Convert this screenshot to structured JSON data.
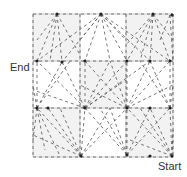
{
  "labels": {
    "end": "End",
    "start": "Start"
  },
  "grid": {
    "rows": 3,
    "cols": 3,
    "x0": 33,
    "y0": 14,
    "x1": 173,
    "y1": 157,
    "col_lines": [
      33,
      80,
      126,
      173
    ],
    "row_lines": [
      14,
      61,
      108,
      157
    ],
    "shaded_cells": [
      [
        0,
        0
      ],
      [
        0,
        2
      ],
      [
        1,
        1
      ],
      [
        2,
        0
      ],
      [
        2,
        2
      ]
    ]
  },
  "colors": {
    "background": "#ffffff",
    "cell_shade": "#f2f2f2",
    "grid_line": "#cccccc",
    "dash": "#555555",
    "node": "#222222",
    "text": "#333333"
  },
  "nodes": [
    [
      57,
      14
    ],
    [
      101,
      14
    ],
    [
      153,
      14
    ],
    [
      172,
      15
    ],
    [
      37,
      61
    ],
    [
      62,
      62
    ],
    [
      85,
      61
    ],
    [
      127,
      61
    ],
    [
      150,
      61
    ],
    [
      170,
      61
    ],
    [
      37,
      108
    ],
    [
      48,
      108
    ],
    [
      85,
      108
    ],
    [
      127,
      108
    ],
    [
      150,
      108
    ],
    [
      170,
      108
    ],
    [
      81,
      156
    ],
    [
      127,
      155
    ],
    [
      150,
      156
    ],
    [
      172,
      156
    ]
  ],
  "fans": [
    {
      "from": [
        101,
        14
      ],
      "to": [
        [
          37,
          61
        ],
        [
          62,
          62
        ],
        [
          85,
          61
        ],
        [
          110,
          61
        ],
        [
          127,
          61
        ],
        [
          150,
          61
        ],
        [
          170,
          61
        ],
        [
          80,
          40
        ],
        [
          126,
          40
        ]
      ]
    },
    {
      "from": [
        57,
        14
      ],
      "to": [
        [
          37,
          40
        ],
        [
          37,
          61
        ],
        [
          50,
          61
        ],
        [
          62,
          62
        ],
        [
          80,
          55
        ]
      ]
    },
    {
      "from": [
        153,
        14
      ],
      "to": [
        [
          126,
          45
        ],
        [
          127,
          61
        ],
        [
          140,
          61
        ],
        [
          150,
          61
        ],
        [
          170,
          61
        ],
        [
          173,
          40
        ]
      ]
    },
    {
      "from": [
        85,
        108
      ],
      "to": [
        [
          37,
          61
        ],
        [
          62,
          62
        ],
        [
          85,
          61
        ],
        [
          110,
          61
        ],
        [
          127,
          61
        ],
        [
          150,
          61
        ],
        [
          33,
          90
        ],
        [
          126,
          80
        ]
      ]
    },
    {
      "from": [
        127,
        108
      ],
      "to": [
        [
          85,
          61
        ],
        [
          110,
          61
        ],
        [
          127,
          61
        ],
        [
          150,
          61
        ],
        [
          170,
          61
        ],
        [
          173,
          85
        ],
        [
          80,
          85
        ]
      ]
    },
    {
      "from": [
        37,
        108
      ],
      "to": [
        [
          37,
          61
        ],
        [
          62,
          62
        ],
        [
          33,
          85
        ],
        [
          70,
          61
        ]
      ]
    },
    {
      "from": [
        170,
        108
      ],
      "to": [
        [
          170,
          61
        ],
        [
          150,
          61
        ],
        [
          173,
          85
        ],
        [
          140,
          61
        ]
      ]
    },
    {
      "from": [
        81,
        156
      ],
      "to": [
        [
          37,
          108
        ],
        [
          48,
          108
        ],
        [
          85,
          108
        ],
        [
          110,
          108
        ],
        [
          127,
          108
        ],
        [
          33,
          135
        ],
        [
          60,
          108
        ]
      ]
    },
    {
      "from": [
        127,
        155
      ],
      "to": [
        [
          85,
          108
        ],
        [
          110,
          108
        ],
        [
          127,
          108
        ],
        [
          150,
          108
        ],
        [
          170,
          108
        ],
        [
          100,
          108
        ]
      ]
    },
    {
      "from": [
        172,
        156
      ],
      "to": [
        [
          127,
          108
        ],
        [
          150,
          108
        ],
        [
          170,
          108
        ],
        [
          173,
          130
        ],
        [
          140,
          108
        ],
        [
          130,
          140
        ]
      ]
    },
    {
      "from": [
        37,
        108
      ],
      "to": [
        [
          45,
          150
        ],
        [
          60,
          156
        ],
        [
          33,
          140
        ]
      ]
    },
    {
      "from": [
        170,
        15
      ],
      "to": [
        [
          173,
          61
        ],
        [
          160,
          40
        ]
      ]
    }
  ]
}
